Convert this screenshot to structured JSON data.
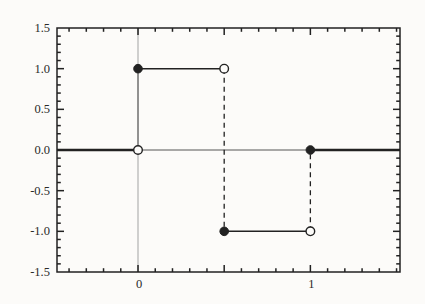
{
  "figure": {
    "background": "#fcfbf9",
    "ink": "#222222",
    "grid_color": "#999999",
    "zero_line_color": "#555555"
  },
  "chart_data": {
    "type": "line",
    "title": "",
    "xlabel": "",
    "ylabel": "",
    "xlim": [
      -0.47,
      1.52
    ],
    "ylim": [
      -1.5,
      1.5
    ],
    "x_major_ticks": [
      0,
      0.5,
      1
    ],
    "y_major_ticks": [
      -1.5,
      -1.0,
      -0.5,
      0.0,
      0.5,
      1.0,
      1.5
    ],
    "x_minor_step": 0.1,
    "y_minor_step": 0.1,
    "x_tick_labels": [
      {
        "value": 0,
        "label": "0"
      },
      {
        "value": 1,
        "label": "1"
      }
    ],
    "y_tick_labels": [
      {
        "value": 1.5,
        "label": "1.5"
      },
      {
        "value": 1.0,
        "label": "1.0"
      },
      {
        "value": 0.5,
        "label": "0.5"
      },
      {
        "value": 0.0,
        "label": "0.0"
      },
      {
        "value": -0.5,
        "label": "-0.5"
      },
      {
        "value": -1.0,
        "label": "-1.0"
      },
      {
        "value": -1.5,
        "label": "-1.5"
      }
    ],
    "reference_lines": [
      {
        "kind": "vline",
        "x": 0,
        "from": -1.5,
        "to": 1.5,
        "style": "hairline"
      },
      {
        "kind": "hline",
        "y": 0,
        "from": 0,
        "to": 1,
        "style": "thin"
      }
    ],
    "segments": [
      {
        "x1": -0.47,
        "y1": 0,
        "x2": 0,
        "y2": 0,
        "style": "thick"
      },
      {
        "x1": 0,
        "y1": 0,
        "x2": 0,
        "y2": 1,
        "style": "thin"
      },
      {
        "x1": 0,
        "y1": 1,
        "x2": 0.5,
        "y2": 1,
        "style": "solid"
      },
      {
        "x1": 0.5,
        "y1": 1,
        "x2": 0.5,
        "y2": -1,
        "style": "dashed"
      },
      {
        "x1": 0.5,
        "y1": -1,
        "x2": 1,
        "y2": -1,
        "style": "solid"
      },
      {
        "x1": 1,
        "y1": -1,
        "x2": 1,
        "y2": 0,
        "style": "dashed"
      },
      {
        "x1": 1,
        "y1": 0,
        "x2": 1.52,
        "y2": 0,
        "style": "thick"
      }
    ],
    "points": [
      {
        "x": 0,
        "y": 1,
        "marker": "filled"
      },
      {
        "x": 0.5,
        "y": 1,
        "marker": "open"
      },
      {
        "x": 0,
        "y": 0,
        "marker": "open"
      },
      {
        "x": 1,
        "y": 0,
        "marker": "filled"
      },
      {
        "x": 0.5,
        "y": -1,
        "marker": "filled"
      },
      {
        "x": 1,
        "y": -1,
        "marker": "open"
      }
    ]
  }
}
